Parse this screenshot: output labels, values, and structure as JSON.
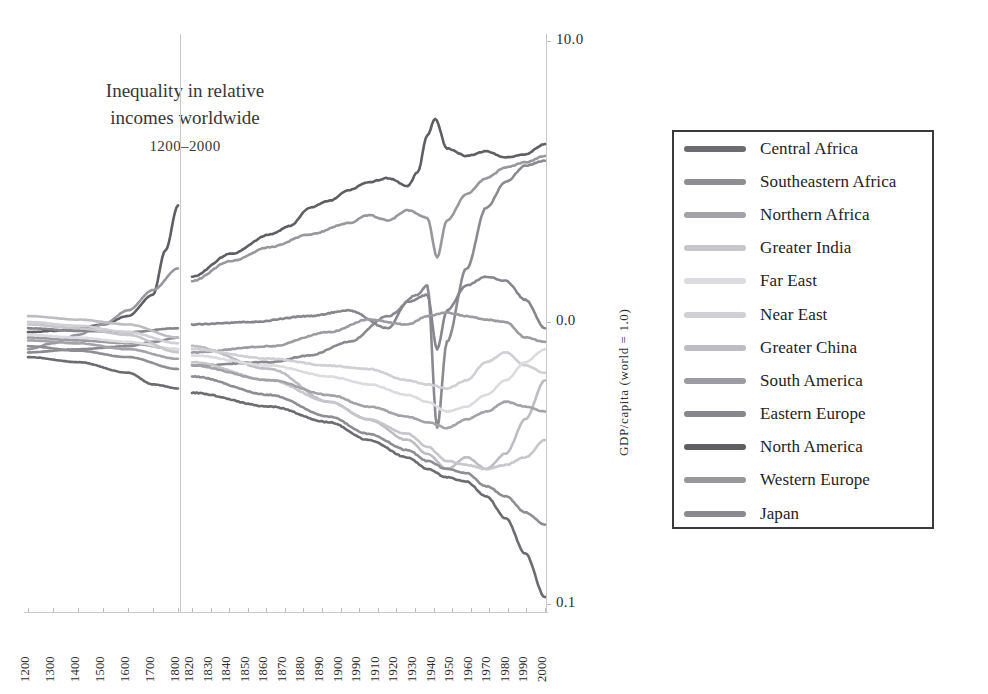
{
  "figure": {
    "title_line1": "Inequality in relative",
    "title_line2": "incomes worldwide",
    "title_line3": "1200–2000"
  },
  "axes": {
    "y_title": "GDP/capita (world = 1.0)",
    "y_tick_labels": [
      "10.0",
      "0.0",
      "0.1"
    ],
    "x_tick_labels_left": [
      "1200",
      "1300",
      "1400",
      "1500",
      "1600",
      "1700",
      "1800"
    ],
    "x_tick_labels_right": [
      "1820",
      "1830",
      "1840",
      "1850",
      "1860",
      "1870",
      "1880",
      "1890",
      "1900",
      "1990",
      "1910",
      "1920",
      "1930",
      "1940",
      "1950",
      "1960",
      "1970",
      "1980",
      "1990",
      "2000"
    ]
  },
  "legend": {
    "items": [
      {
        "label": "Central Africa",
        "color": "#6b6b70"
      },
      {
        "label": "Southeastern Africa",
        "color": "#8d8d93"
      },
      {
        "label": "Northern Africa",
        "color": "#a2a2a8"
      },
      {
        "label": "Greater India",
        "color": "#c6c6cb"
      },
      {
        "label": "Far East",
        "color": "#dcdce0"
      },
      {
        "label": "Near East",
        "color": "#cfcfd4"
      },
      {
        "label": "Greater China",
        "color": "#bcbcc2"
      },
      {
        "label": "South America",
        "color": "#9b9ba1"
      },
      {
        "label": "Eastern Europe",
        "color": "#86868c"
      },
      {
        "label": "North America",
        "color": "#5e5e63"
      },
      {
        "label": "Western Europe",
        "color": "#97979d"
      },
      {
        "label": "Japan",
        "color": "#8a8a90"
      }
    ]
  },
  "chart_data": {
    "type": "line",
    "title": "Inequality in relative incomes worldwide 1200–2000",
    "xlabel": "",
    "ylabel": "GDP/capita (world = 1.0)",
    "yscale": "log",
    "ylim": [
      0.1,
      10.0
    ],
    "y_ticks": [
      10.0,
      1.0,
      0.1
    ],
    "grid": false,
    "legend_position": "right-outside",
    "panels": [
      {
        "name": "pre-industrial",
        "x_range": [
          1200,
          1800
        ],
        "x_ticks": [
          1200,
          1300,
          1400,
          1500,
          1600,
          1700,
          1800
        ]
      },
      {
        "name": "industrial",
        "x_range": [
          1820,
          2000
        ],
        "x_ticks": [
          1820,
          1830,
          1840,
          1850,
          1860,
          1870,
          1880,
          1890,
          1900,
          1910,
          1920,
          1930,
          1940,
          1950,
          1960,
          1970,
          1980,
          1990,
          2000
        ]
      }
    ],
    "series": [
      {
        "name": "North America",
        "color": "#5e5e63",
        "left_x": [
          1200,
          1300,
          1400,
          1500,
          1600,
          1700,
          1750,
          1800
        ],
        "left_y": [
          0.92,
          0.93,
          0.95,
          0.98,
          1.05,
          1.25,
          1.8,
          2.6
        ],
        "right_x": [
          1820,
          1840,
          1860,
          1870,
          1880,
          1890,
          1900,
          1910,
          1920,
          1930,
          1935,
          1940,
          1944,
          1950,
          1960,
          1970,
          1980,
          1990,
          2000
        ],
        "right_y": [
          1.45,
          1.75,
          2.05,
          2.2,
          2.55,
          2.7,
          2.95,
          3.15,
          3.25,
          3.05,
          3.4,
          4.6,
          5.3,
          4.15,
          3.9,
          4.05,
          3.85,
          3.95,
          4.3
        ]
      },
      {
        "name": "Western Europe",
        "color": "#97979d",
        "left_x": [
          1200,
          1300,
          1400,
          1500,
          1600,
          1700,
          1800
        ],
        "left_y": [
          0.8,
          0.84,
          0.9,
          0.98,
          1.1,
          1.3,
          1.55
        ],
        "right_x": [
          1820,
          1840,
          1860,
          1880,
          1900,
          1910,
          1920,
          1930,
          1940,
          1945,
          1950,
          1960,
          1970,
          1980,
          1990,
          2000
        ],
        "right_y": [
          1.4,
          1.65,
          1.85,
          2.05,
          2.25,
          2.4,
          2.3,
          2.5,
          2.35,
          1.7,
          2.3,
          2.85,
          3.25,
          3.55,
          3.7,
          3.9
        ]
      },
      {
        "name": "Japan",
        "color": "#8a8a90",
        "left_x": [
          1200,
          1400,
          1600,
          1700,
          1800
        ],
        "left_y": [
          0.78,
          0.8,
          0.82,
          0.85,
          0.88
        ],
        "right_x": [
          1820,
          1860,
          1880,
          1900,
          1920,
          1935,
          1940,
          1945,
          1950,
          1960,
          1970,
          1980,
          1990,
          2000
        ],
        "right_y": [
          0.7,
          0.72,
          0.76,
          0.85,
          1.05,
          1.25,
          1.35,
          0.42,
          0.85,
          1.55,
          2.55,
          3.15,
          3.6,
          3.75
        ]
      },
      {
        "name": "Eastern Europe",
        "color": "#86868c",
        "left_x": [
          1200,
          1400,
          1600,
          1800
        ],
        "left_y": [
          0.95,
          0.93,
          0.92,
          0.95
        ],
        "right_x": [
          1820,
          1850,
          1880,
          1900,
          1920,
          1930,
          1940,
          1945,
          1950,
          1960,
          1970,
          1980,
          1990,
          2000
        ],
        "right_y": [
          0.98,
          1.0,
          1.05,
          1.1,
          0.95,
          1.18,
          1.25,
          0.8,
          1.1,
          1.35,
          1.45,
          1.4,
          1.2,
          0.95
        ]
      },
      {
        "name": "South America",
        "color": "#9b9ba1",
        "left_x": [
          1200,
          1400,
          1600,
          1800
        ],
        "left_y": [
          0.88,
          0.86,
          0.84,
          0.8
        ],
        "right_x": [
          1820,
          1860,
          1890,
          1910,
          1930,
          1940,
          1950,
          1960,
          1970,
          1980,
          1990,
          2000
        ],
        "right_y": [
          0.78,
          0.82,
          0.92,
          1.02,
          0.98,
          1.05,
          1.08,
          1.05,
          1.02,
          1.0,
          0.88,
          0.85
        ]
      },
      {
        "name": "Greater China",
        "color": "#bcbcc2",
        "left_x": [
          1200,
          1400,
          1600,
          1800
        ],
        "left_y": [
          1.05,
          1.02,
          0.98,
          0.88
        ],
        "right_x": [
          1820,
          1860,
          1890,
          1910,
          1930,
          1940,
          1950,
          1960,
          1970,
          1980,
          1990,
          2000
        ],
        "right_y": [
          0.82,
          0.68,
          0.52,
          0.45,
          0.38,
          0.34,
          0.3,
          0.33,
          0.3,
          0.34,
          0.45,
          0.62
        ]
      },
      {
        "name": "Near East",
        "color": "#cfcfd4",
        "left_x": [
          1200,
          1400,
          1600,
          1800
        ],
        "left_y": [
          1.0,
          0.97,
          0.92,
          0.84
        ],
        "right_x": [
          1820,
          1860,
          1890,
          1910,
          1930,
          1940,
          1950,
          1960,
          1970,
          1980,
          1990,
          2000
        ],
        "right_y": [
          0.8,
          0.74,
          0.7,
          0.68,
          0.62,
          0.6,
          0.58,
          0.62,
          0.72,
          0.78,
          0.7,
          0.66
        ]
      },
      {
        "name": "Far East",
        "color": "#dcdce0",
        "left_x": [
          1200,
          1400,
          1600,
          1800
        ],
        "left_y": [
          0.9,
          0.88,
          0.85,
          0.8
        ],
        "right_x": [
          1820,
          1860,
          1890,
          1910,
          1930,
          1940,
          1950,
          1960,
          1970,
          1980,
          1990,
          2000
        ],
        "right_y": [
          0.76,
          0.7,
          0.64,
          0.6,
          0.55,
          0.52,
          0.48,
          0.5,
          0.55,
          0.62,
          0.72,
          0.8
        ]
      },
      {
        "name": "Greater India",
        "color": "#c6c6cb",
        "left_x": [
          1200,
          1400,
          1600,
          1800
        ],
        "left_y": [
          0.98,
          0.95,
          0.9,
          0.78
        ],
        "right_x": [
          1820,
          1860,
          1890,
          1910,
          1930,
          1940,
          1950,
          1960,
          1970,
          1980,
          1990,
          2000
        ],
        "right_y": [
          0.72,
          0.62,
          0.52,
          0.45,
          0.4,
          0.36,
          0.32,
          0.31,
          0.3,
          0.31,
          0.33,
          0.38
        ]
      },
      {
        "name": "Northern Africa",
        "color": "#a2a2a8",
        "left_x": [
          1200,
          1400,
          1600,
          1800
        ],
        "left_y": [
          0.86,
          0.84,
          0.8,
          0.74
        ],
        "right_x": [
          1820,
          1860,
          1890,
          1910,
          1930,
          1940,
          1950,
          1960,
          1970,
          1980,
          1990,
          2000
        ],
        "right_y": [
          0.7,
          0.62,
          0.55,
          0.5,
          0.46,
          0.44,
          0.42,
          0.45,
          0.48,
          0.52,
          0.5,
          0.48
        ]
      },
      {
        "name": "Southeastern Africa",
        "color": "#8d8d93",
        "left_x": [
          1200,
          1400,
          1600,
          1800
        ],
        "left_y": [
          0.82,
          0.79,
          0.75,
          0.68
        ],
        "right_x": [
          1820,
          1860,
          1890,
          1910,
          1930,
          1940,
          1950,
          1960,
          1970,
          1980,
          1990,
          2000
        ],
        "right_y": [
          0.64,
          0.55,
          0.46,
          0.4,
          0.35,
          0.32,
          0.3,
          0.29,
          0.26,
          0.24,
          0.21,
          0.19
        ]
      },
      {
        "name": "Central Africa",
        "color": "#6b6b70",
        "left_x": [
          1200,
          1400,
          1600,
          1700,
          1800
        ],
        "left_y": [
          0.75,
          0.72,
          0.66,
          0.6,
          0.58
        ],
        "right_x": [
          1820,
          1860,
          1890,
          1910,
          1930,
          1940,
          1950,
          1960,
          1970,
          1980,
          1990,
          2000
        ],
        "right_y": [
          0.56,
          0.5,
          0.44,
          0.38,
          0.33,
          0.3,
          0.28,
          0.27,
          0.24,
          0.2,
          0.15,
          0.105
        ]
      }
    ]
  }
}
